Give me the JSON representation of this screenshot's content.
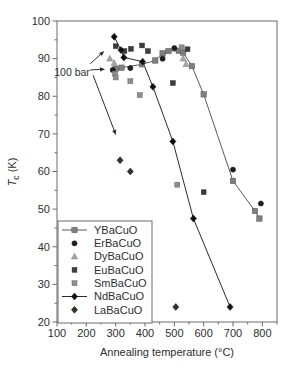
{
  "chart_data": {
    "type": "scatter",
    "title": "",
    "xlabel": "Annealing temperature (°C)",
    "ylabel": "Tc (K)",
    "ylabel_parts": {
      "base": "T",
      "sub": "c",
      "units": " (K)"
    },
    "xlim": [
      100,
      850
    ],
    "ylim": [
      20,
      100
    ],
    "x_ticks": [
      100,
      200,
      300,
      400,
      500,
      600,
      700,
      800
    ],
    "y_ticks": [
      20,
      30,
      40,
      50,
      60,
      70,
      80,
      90,
      100
    ],
    "grid": false,
    "legend_position": "lower-left",
    "frame_color": "#6a6a6a",
    "text_color": "#2e2e2e",
    "annotation": {
      "label": "100 bar",
      "anchor": [
        212,
        86.4
      ],
      "arrows": [
        {
          "from": [
            213,
            88.6
          ],
          "to": [
            261,
            92.0
          ]
        },
        {
          "from": [
            213,
            87.0
          ],
          "to": [
            264,
            87.2
          ]
        },
        {
          "from": [
            223,
            85.6
          ],
          "to": [
            301,
            69.7
          ]
        }
      ]
    },
    "series": [
      {
        "name": "YBaCuO",
        "marker": "square",
        "fill": "#7e7e7e",
        "stroke": "#555555",
        "line": "#5a5a5a",
        "size": 5.4,
        "points": [
          [
            300,
            87.3
          ],
          [
            320,
            87.6
          ],
          [
            390,
            88.5
          ],
          [
            435,
            89.5
          ],
          [
            460,
            91.4
          ],
          [
            480,
            92.0
          ],
          [
            515,
            92.1
          ],
          [
            530,
            91.6
          ],
          [
            560,
            88.0
          ],
          [
            600,
            80.5
          ],
          [
            700,
            57.5
          ],
          [
            775,
            49.5
          ],
          [
            790,
            47.5
          ]
        ]
      },
      {
        "name": "ErBaCuO",
        "marker": "circle",
        "fill": "#1e1e1e",
        "stroke": "#1e1e1e",
        "line": null,
        "size": 5.2,
        "points": [
          [
            290,
            87.0
          ],
          [
            350,
            87.5
          ],
          [
            460,
            90.0
          ],
          [
            500,
            92.8
          ],
          [
            700,
            60.5
          ],
          [
            795,
            51.5
          ]
        ]
      },
      {
        "name": "DyBaCuO",
        "marker": "triangle",
        "fill": "#a6a6a6",
        "stroke": "#7c7c7c",
        "line": null,
        "size": 6,
        "points": [
          [
            280,
            90.0
          ],
          [
            295,
            88.8
          ],
          [
            530,
            90.0
          ],
          [
            540,
            88.5
          ]
        ]
      },
      {
        "name": "EuBaCuO",
        "marker": "square",
        "fill": "#3b3b3b",
        "stroke": "#2a2a2a",
        "line": null,
        "size": 4.8,
        "points": [
          [
            300,
            93.3
          ],
          [
            330,
            92.0
          ],
          [
            352,
            92.6
          ],
          [
            390,
            93.5
          ],
          [
            410,
            92.0
          ],
          [
            545,
            92.5
          ],
          [
            495,
            83.5
          ],
          [
            600,
            54.5
          ]
        ]
      },
      {
        "name": "SmBaCuO",
        "marker": "square",
        "fill": "#8d8d8d",
        "stroke": "#6b6b6b",
        "line": null,
        "size": 5.0,
        "points": [
          [
            298,
            86.0
          ],
          [
            300,
            85.0
          ],
          [
            350,
            84.0
          ],
          [
            382,
            80.3
          ],
          [
            525,
            93.0
          ],
          [
            510,
            56.5
          ]
        ]
      },
      {
        "name": "NdBaCuO",
        "marker": "diamond",
        "fill": "#101010",
        "stroke": "#101010",
        "line": "#2b2b2b",
        "size": 7,
        "points": [
          [
            295,
            95.8
          ],
          [
            318,
            92.3
          ],
          [
            328,
            90.3
          ],
          [
            392,
            89.2
          ],
          [
            427,
            82.5
          ],
          [
            495,
            68.0
          ],
          [
            565,
            47.5
          ],
          [
            690,
            24.0
          ]
        ]
      },
      {
        "name": "LaBaCuO",
        "marker": "diamond",
        "fill": "#382c2c",
        "stroke": "#241c1c",
        "line": null,
        "size": 7,
        "points": [
          [
            315,
            63.0
          ],
          [
            350,
            60.0
          ],
          [
            505,
            24.0
          ]
        ]
      }
    ]
  }
}
